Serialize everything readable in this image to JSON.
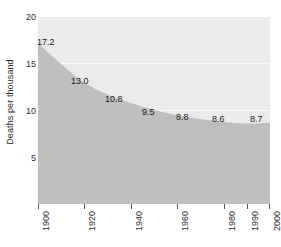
{
  "chart_data": {
    "type": "area",
    "title": "",
    "xlabel": "",
    "ylabel": "Deaths per thousand",
    "x": [
      1900,
      1920,
      1940,
      1960,
      1980,
      1990,
      2000
    ],
    "values": [
      17.2,
      13.0,
      10.8,
      9.5,
      8.8,
      8.6,
      8.7
    ],
    "point_labels": [
      "17.2",
      "13.0",
      "10.8",
      "9.5",
      "8.8",
      "8.6",
      "8.7"
    ],
    "x_tick_labels": [
      "1900",
      "1920",
      "1940",
      "1960",
      "1980",
      "1990",
      "2000"
    ],
    "y_tick_labels": [
      "20",
      "15",
      "10",
      "5"
    ],
    "y_ticks": [
      20,
      15,
      10,
      5
    ],
    "ylim": [
      0,
      20
    ],
    "xlim": [
      1900,
      2000
    ],
    "grid": "horizontal-white-gridlines",
    "legend": "none",
    "colors": {
      "area_fill": "#bfbfbf",
      "plot_background": "#ebebeb",
      "gridline": "#fafafa",
      "text": "#2b2b2b",
      "page_background": "#ffffff"
    }
  },
  "axes": {
    "y_title": "Deaths per thousand"
  }
}
